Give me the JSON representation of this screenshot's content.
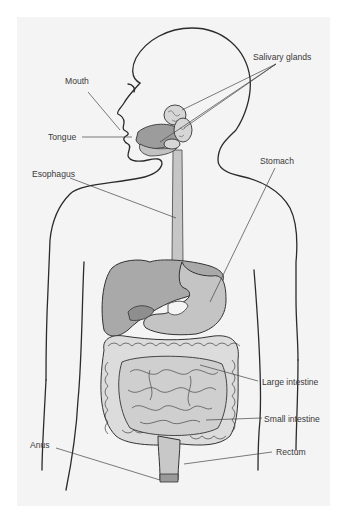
{
  "colors": {
    "background": "#ffffff",
    "panel": "#f4f4f4",
    "outline": "#2b2b2b",
    "organ_fill": "#b8b8b8",
    "organ_dark": "#8e8e8e",
    "intestine_fill": "#dcdcdc",
    "leader_line": "#444444"
  },
  "labels": {
    "salivary_glands": "Salivary glands",
    "mouth": "Mouth",
    "tongue": "Tongue",
    "esophagus": "Esophagus",
    "stomach": "Stomach",
    "large_intestine": "Large intestine",
    "small_intestine": "Small intestine",
    "anus": "Anus",
    "rectum": "Rectum"
  }
}
